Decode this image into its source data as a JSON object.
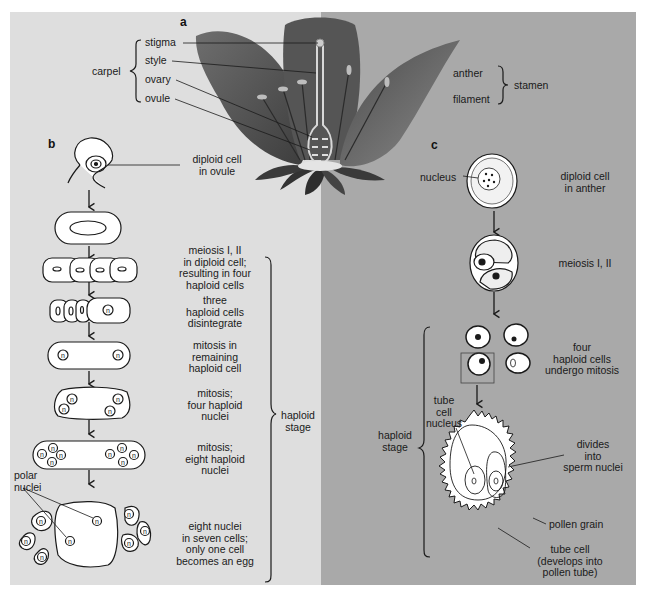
{
  "panels": {
    "a": {
      "letter": "a",
      "carpel_group_label": "carpel",
      "carpel_parts": [
        "stigma",
        "style",
        "ovary",
        "ovule"
      ],
      "stamen_group_label": "stamen",
      "stamen_parts": [
        "anther",
        "filament"
      ]
    },
    "b": {
      "letter": "b",
      "steps": [
        {
          "label": "diploid cell\nin ovule"
        },
        {
          "label": "meiosis I, II\nin diploid cell;\nresulting in four\nhaploid cells"
        },
        {
          "label": "three\nhaploid cells\ndisintegrate"
        },
        {
          "label": "mitosis in\nremaining\nhaploid cell"
        },
        {
          "label": "mitosis;\nfour haploid\nnuclei"
        },
        {
          "label": "mitosis;\neight haploid\nnuclei"
        },
        {
          "label": "eight nuclei\nin seven cells;\nonly one cell\nbecomes an egg"
        }
      ],
      "polar_nuclei_label": "polar\nnuclei",
      "stage_label": "haploid\nstage",
      "nucleus_symbol": "n"
    },
    "c": {
      "letter": "c",
      "nucleus_label": "nucleus",
      "steps": [
        {
          "label": "diploid cell\nin anther"
        },
        {
          "label": "meiosis I, II"
        },
        {
          "label": "four\nhaploid cells\nundergo mitosis"
        }
      ],
      "stage_label": "haploid\nstage",
      "tube_cell_nucleus_label": "tube\ncell\nnucleus",
      "divides_label": "divides\ninto\nsperm nuclei",
      "pollen_grain_label": "pollen grain",
      "tube_cell_label": "tube cell\n(develops into\npollen tube)"
    }
  },
  "colors": {
    "left_bg": "#dedede",
    "right_bg": "#a9a9a9",
    "line": "#1a1a1a",
    "petal": "#5a5a5a"
  }
}
